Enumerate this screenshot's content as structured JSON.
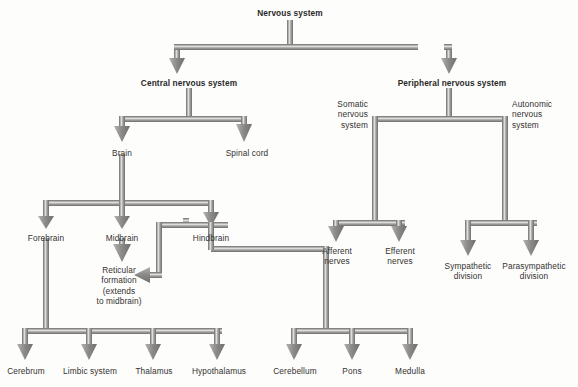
{
  "diagram": {
    "title": "Nervous system",
    "background": "#fdfdfc",
    "pipe_color": "#9a9a98",
    "pipe_highlight": "#d8d8d6",
    "pipe_edge": "#6e6d6b",
    "text_color": "#333230",
    "nodes": [
      {
        "id": "nervous-system",
        "label": "Nervous system",
        "bold": true,
        "align": "center",
        "x": 290,
        "y": 8,
        "level": 0
      },
      {
        "id": "central-nervous-system",
        "label": "Central nervous system",
        "bold": true,
        "align": "center",
        "x": 189,
        "y": 78,
        "level": 1
      },
      {
        "id": "peripheral-nervous-system",
        "label": "Peripheral nervous system",
        "bold": true,
        "align": "center",
        "x": 452,
        "y": 78,
        "level": 1
      },
      {
        "id": "brain",
        "label": "Brain",
        "bold": false,
        "align": "center",
        "x": 122,
        "y": 148,
        "level": 2
      },
      {
        "id": "spinal-cord",
        "label": "Spinal cord",
        "bold": false,
        "align": "center",
        "x": 247,
        "y": 148,
        "level": 2
      },
      {
        "id": "somatic-nervous-system",
        "label": "Somatic\nnervous\nsystem",
        "bold": false,
        "align": "right",
        "x": 368,
        "y": 103,
        "level": 2
      },
      {
        "id": "autonomic-nervous-system",
        "label": "Autonomic\nnervous\nsystem",
        "bold": false,
        "align": "left",
        "x": 508,
        "y": 103,
        "level": 2
      },
      {
        "id": "forebrain",
        "label": "Forebrain",
        "bold": false,
        "align": "center",
        "x": 46,
        "y": 233,
        "level": 3
      },
      {
        "id": "midbrain",
        "label": "Midbrain",
        "bold": false,
        "align": "center",
        "x": 122,
        "y": 233,
        "level": 3
      },
      {
        "id": "hindbrain",
        "label": "Hindbrain",
        "bold": false,
        "align": "center",
        "x": 211,
        "y": 233,
        "level": 3
      },
      {
        "id": "reticular-formation",
        "label": "Reticular\nformation\n(extends\nto midbrain)",
        "bold": false,
        "align": "center",
        "x": 119,
        "y": 268,
        "level": 4
      },
      {
        "id": "afferent-nerves",
        "label": "Afferent\nnerves",
        "bold": false,
        "align": "center",
        "x": 339,
        "y": 230,
        "level": 3
      },
      {
        "id": "efferent-nerves",
        "label": "Efferent\nnerves",
        "bold": false,
        "align": "center",
        "x": 400,
        "y": 230,
        "level": 3
      },
      {
        "id": "sympathetic-division",
        "label": "Sympathetic\ndivision",
        "bold": false,
        "align": "center",
        "x": 468,
        "y": 263,
        "level": 3
      },
      {
        "id": "parasympathetic-division",
        "label": "Parasympathetic\ndivision",
        "bold": false,
        "align": "center",
        "x": 534,
        "y": 263,
        "level": 3
      },
      {
        "id": "cerebrum",
        "label": "Cerebrum",
        "bold": false,
        "align": "center",
        "x": 25,
        "y": 370,
        "level": 4
      },
      {
        "id": "limbic-system",
        "label": "Limbic system",
        "bold": false,
        "align": "center",
        "x": 90,
        "y": 370,
        "level": 4
      },
      {
        "id": "thalamus",
        "label": "Thalamus",
        "bold": false,
        "align": "center",
        "x": 154,
        "y": 370,
        "level": 4
      },
      {
        "id": "hypothalamus",
        "label": "Hypothalamus",
        "bold": false,
        "align": "center",
        "x": 218,
        "y": 370,
        "level": 4
      },
      {
        "id": "cerebellum",
        "label": "Cerebellum",
        "bold": false,
        "align": "center",
        "x": 294,
        "y": 370,
        "level": 4
      },
      {
        "id": "pons",
        "label": "Pons",
        "bold": false,
        "align": "center",
        "x": 352,
        "y": 370,
        "level": 4
      },
      {
        "id": "medulla",
        "label": "Medulla",
        "bold": false,
        "align": "center",
        "x": 410,
        "y": 370,
        "level": 4
      }
    ],
    "edges": [
      {
        "from": "nervous-system",
        "to": "central-nervous-system"
      },
      {
        "from": "nervous-system",
        "to": "peripheral-nervous-system"
      },
      {
        "from": "central-nervous-system",
        "to": "brain"
      },
      {
        "from": "central-nervous-system",
        "to": "spinal-cord"
      },
      {
        "from": "brain",
        "to": "forebrain"
      },
      {
        "from": "brain",
        "to": "midbrain"
      },
      {
        "from": "brain",
        "to": "hindbrain"
      },
      {
        "from": "midbrain",
        "to": "reticular-formation"
      },
      {
        "from": "hindbrain",
        "to": "reticular-formation"
      },
      {
        "from": "forebrain",
        "to": "cerebrum"
      },
      {
        "from": "forebrain",
        "to": "limbic-system"
      },
      {
        "from": "forebrain",
        "to": "thalamus"
      },
      {
        "from": "forebrain",
        "to": "hypothalamus"
      },
      {
        "from": "hindbrain",
        "to": "cerebellum"
      },
      {
        "from": "hindbrain",
        "to": "pons"
      },
      {
        "from": "hindbrain",
        "to": "medulla"
      },
      {
        "from": "peripheral-nervous-system",
        "to": "somatic-nervous-system"
      },
      {
        "from": "peripheral-nervous-system",
        "to": "autonomic-nervous-system"
      },
      {
        "from": "somatic-nervous-system",
        "to": "afferent-nerves"
      },
      {
        "from": "somatic-nervous-system",
        "to": "efferent-nerves"
      },
      {
        "from": "autonomic-nervous-system",
        "to": "sympathetic-division"
      },
      {
        "from": "autonomic-nervous-system",
        "to": "parasympathetic-division"
      }
    ]
  }
}
